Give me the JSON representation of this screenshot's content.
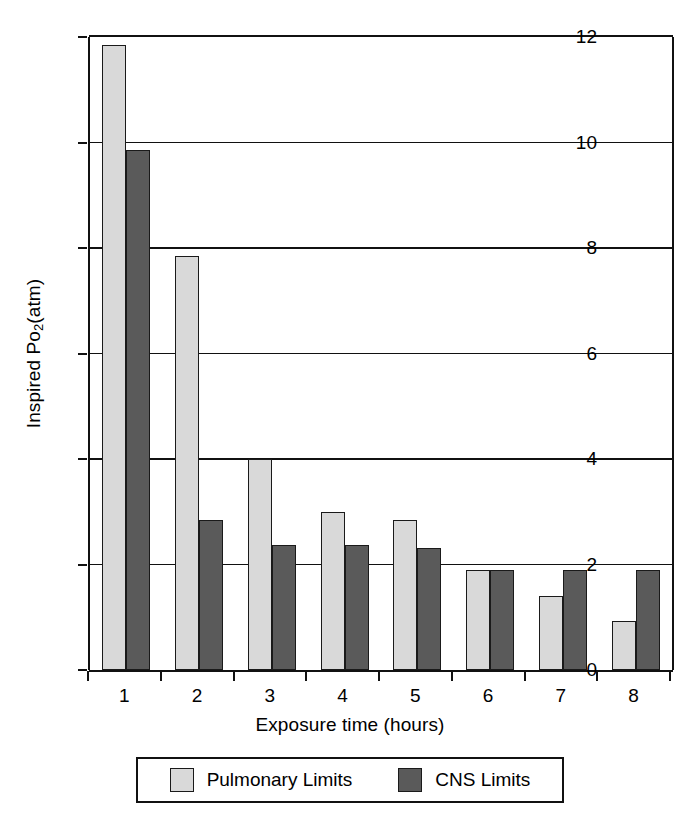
{
  "chart_data": {
    "type": "bar",
    "title": "",
    "xlabel": "Exposure time (hours)",
    "ylabel": "Inspired Po2 (atm)",
    "ylabel_parts": {
      "prefix": "Inspired Po",
      "subscript": "2",
      "suffix": " (atm)"
    },
    "categories": [
      "1",
      "2",
      "3",
      "4",
      "5",
      "6",
      "7",
      "8"
    ],
    "series": [
      {
        "name": "Pulmonary Limits",
        "color": "#d9d9d9",
        "values": [
          11.85,
          7.85,
          4.0,
          3.0,
          2.85,
          1.9,
          1.4,
          0.92
        ]
      },
      {
        "name": "CNS Limits",
        "color": "#5a5a5a",
        "values": [
          9.85,
          2.85,
          2.37,
          2.37,
          2.32,
          1.9,
          1.9,
          1.9
        ]
      }
    ],
    "ylim": [
      0,
      12
    ],
    "yticks": [
      0,
      2,
      4,
      6,
      8,
      10,
      12
    ],
    "ytick_labels": [
      "0",
      "2",
      "4",
      "6",
      "8",
      "10",
      "12"
    ],
    "grid": true,
    "grid_axis": "y",
    "legend_position": "bottom",
    "bar_edge_color": "#1a1a1a",
    "axis_color": "#111111",
    "background": "#ffffff"
  },
  "legend": {
    "entries": [
      {
        "label": "Pulmonary Limits",
        "color": "#d9d9d9"
      },
      {
        "label": "CNS Limits",
        "color": "#5a5a5a"
      }
    ]
  }
}
